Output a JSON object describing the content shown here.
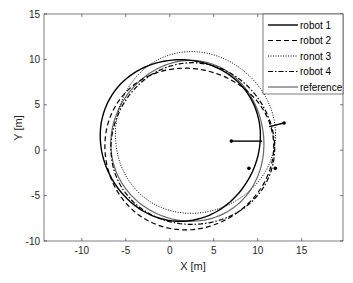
{
  "chart_data": {
    "type": "line",
    "title": "",
    "xlabel": "X [m]",
    "ylabel": "Y [m]",
    "xlim": [
      -14.3,
      19.7
    ],
    "ylim": [
      -10,
      15
    ],
    "xticks": [
      -10,
      -5,
      0,
      5,
      10,
      15
    ],
    "yticks": [
      -10,
      -5,
      0,
      5,
      10,
      15
    ],
    "xtick_labels": [
      "-10",
      "-5",
      "0",
      "5",
      "10",
      "15"
    ],
    "ytick_labels": [
      "-10",
      "-5",
      "0",
      "5",
      "10",
      "15"
    ],
    "grid": false,
    "legend_position": "northeast",
    "series": [
      {
        "name": "robot 1",
        "style": "solid",
        "color": "#000000",
        "width": 1.4,
        "shape": {
          "cx": 1.2,
          "cy": 1.2,
          "rx": 9.1,
          "ry": 8.9
        },
        "start_segment": [
          [
            7.0,
            1.0
          ],
          [
            10.5,
            1.0
          ]
        ],
        "start_marker": [
          7.0,
          1.0
        ]
      },
      {
        "name": "robot 2",
        "style": "dashed",
        "color": "#000000",
        "width": 1.2,
        "shape": {
          "cx": 2.1,
          "cy": 0.2,
          "rx": 9.6,
          "ry": 8.9
        },
        "start_marker": [
          9.0,
          -2.0
        ]
      },
      {
        "name": "ronot 3",
        "style": "dotted",
        "color": "#000000",
        "width": 1.0,
        "shape": {
          "cx": 2.8,
          "cy": 1.9,
          "rx": 9.1,
          "ry": 8.9
        },
        "start_segment": [
          [
            13.0,
            3.0
          ],
          [
            11.3,
            2.6
          ]
        ],
        "start_marker": [
          13.0,
          3.0
        ]
      },
      {
        "name": "robot 4",
        "style": "dashdot",
        "color": "#000000",
        "width": 1.2,
        "shape": {
          "cx": 2.6,
          "cy": 0.6,
          "rx": 9.3,
          "ry": 8.9
        },
        "start_marker": [
          12.0,
          -2.0
        ]
      },
      {
        "name": "reference",
        "style": "solid",
        "color": "#666666",
        "width": 1.2,
        "shape": {
          "cx": 2.1,
          "cy": 0.95,
          "rx": 8.7,
          "ry": 8.85
        }
      }
    ]
  },
  "legend": {
    "items": [
      {
        "label": "robot 1"
      },
      {
        "label": "robot 2"
      },
      {
        "label": "ronot 3"
      },
      {
        "label": "robot 4"
      },
      {
        "label": "reference"
      }
    ]
  },
  "axes": {
    "xlabel": "X [m]",
    "ylabel": "Y [m]"
  }
}
